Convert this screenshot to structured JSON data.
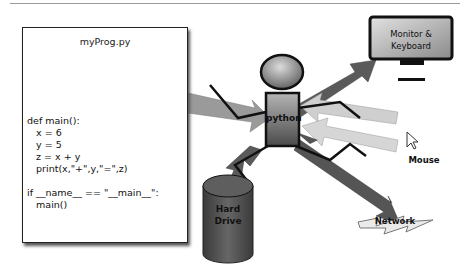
{
  "diagram": {
    "program": {
      "title": "myProg.py",
      "code": "def main():\n   x = 6\n   y = 5\n   z = x + y\n   print(x,\"+\",y,\"=\",z)\n\nif __name__ == \"__main__\":\n   main()"
    },
    "python_label": "python",
    "monitor_label": "Monitor &\nKeyboard",
    "mouse_label": "Mouse",
    "network_label": "Network",
    "hard_drive_label": "Hard\nDrive",
    "icons": {
      "mouse": "cursor-arrow-icon",
      "monitor": "monitor-icon",
      "network": "lightning-bolt-icon",
      "hard_drive": "cylinder-icon",
      "python": "stick-figure-icon"
    },
    "colors": {
      "arrow_dark": "#555555",
      "arrow_light": "#bfbfbf",
      "body_fill": "#777777",
      "drive_fill": "#555555"
    }
  }
}
